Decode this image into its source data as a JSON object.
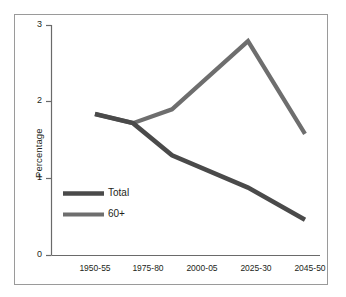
{
  "chart_data": {
    "type": "line",
    "title": "",
    "xlabel": "",
    "ylabel": "Percentage",
    "categories": [
      "1950-55",
      "1975-80",
      "2000-05",
      "2025-30",
      "2045-50"
    ],
    "series": [
      {
        "name": "Total",
        "color": "#4a4a4a",
        "values": [
          1.84,
          1.72,
          1.3,
          0.88,
          0.46
        ]
      },
      {
        "name": "60+",
        "color": "#6e6e6e",
        "values": [
          1.84,
          1.72,
          1.9,
          2.79,
          1.58
        ]
      }
    ],
    "ylim": [
      0,
      3
    ],
    "yticks": [
      0,
      1,
      2,
      3
    ],
    "ytick_labels": [
      "0",
      "1",
      "2",
      "3"
    ],
    "grid": false,
    "legend_position": "inside-lower-left"
  },
  "axis": {
    "y_label": "Percentage",
    "y_ticks": [
      {
        "label": "3",
        "value": 3
      },
      {
        "label": "2",
        "value": 2
      },
      {
        "label": "1",
        "value": 1
      },
      {
        "label": "0",
        "value": 0
      }
    ],
    "x_ticks": [
      {
        "label": "1950-55"
      },
      {
        "label": "1975-80"
      },
      {
        "label": "2000-05"
      },
      {
        "label": "2025-30"
      },
      {
        "label": "2045-50"
      }
    ]
  },
  "legend": {
    "entries": [
      {
        "label": "Total",
        "color": "#4a4a4a"
      },
      {
        "label": "60+",
        "color": "#6e6e6e"
      }
    ]
  },
  "colors": {
    "total_line": "#4a4a4a",
    "sixty_plus_line": "#6e6e6e",
    "axis": "#5a5a5a",
    "frame_border": "#9a9a9a",
    "text": "#231f20",
    "background": "#ffffff"
  }
}
